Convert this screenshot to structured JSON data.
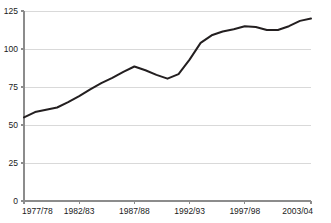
{
  "chart_data": {
    "type": "line",
    "title": "",
    "subtitle": "",
    "xlabel": "",
    "ylabel": "",
    "grid": "horizontal",
    "legend": "none",
    "ylim": [
      0,
      125
    ],
    "yticks": [
      0,
      25,
      50,
      75,
      100,
      125
    ],
    "ytick_labels": [
      "0",
      "25",
      "50",
      "75",
      "100",
      "125"
    ],
    "x": [
      "1977/78",
      "1978/79",
      "1979/80",
      "1980/81",
      "1981/82",
      "1982/83",
      "1983/84",
      "1984/85",
      "1985/86",
      "1986/87",
      "1987/88",
      "1988/89",
      "1989/90",
      "1990/91",
      "1991/92",
      "1992/93",
      "1993/94",
      "1994/95",
      "1995/96",
      "1996/97",
      "1997/98",
      "1998/99",
      "1999/00",
      "2000/01",
      "2001/02",
      "2002/03",
      "2003/04"
    ],
    "xtick_labels": [
      "1977/78",
      "1982/83",
      "1987/88",
      "1992/93",
      "1997/98",
      "2003/04"
    ],
    "xtick_values": [
      "1977/78",
      "1982/83",
      "1987/88",
      "1992/93",
      "1997/98",
      "2003/04"
    ],
    "series": [
      {
        "name": "series-1",
        "color": "#231f20",
        "values": [
          55,
          58.5,
          60,
          61.5,
          65,
          69,
          73.5,
          77.5,
          81,
          85,
          88.5,
          86,
          83,
          80.5,
          83.5,
          93,
          104,
          109,
          111.5,
          113,
          115,
          114.5,
          112.5,
          112.5,
          115,
          118.5,
          120
        ]
      }
    ]
  },
  "axis_colors": {
    "grid": "#d9d9d9",
    "axis": "#8c8c8c",
    "line": "#231f20",
    "text": "#1a1a1a"
  }
}
